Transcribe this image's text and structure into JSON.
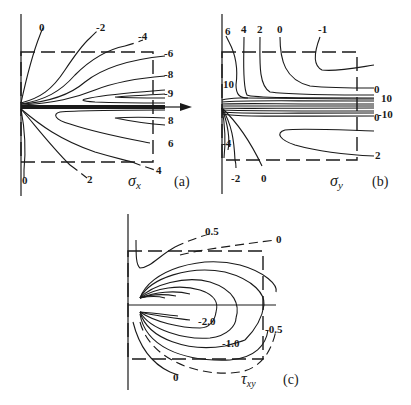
{
  "figure": {
    "panels": [
      {
        "id": "a",
        "caption": "(a)",
        "symbol": "σ",
        "symbol_sub": "x",
        "contour_labels": [
          "0",
          "-2",
          "-4",
          "-6",
          "-8",
          "-9",
          "8",
          "6",
          "4",
          "2",
          "0"
        ]
      },
      {
        "id": "b",
        "caption": "(b)",
        "symbol": "σ",
        "symbol_sub": "y",
        "contour_labels": [
          "6",
          "4",
          "2",
          "0",
          "-1",
          "10",
          "0",
          "10",
          "-10",
          "0",
          "2",
          "-4",
          "-2",
          "0"
        ]
      },
      {
        "id": "c",
        "caption": "(c)",
        "symbol": "τ",
        "symbol_sub": "xy",
        "contour_labels": [
          "0.5",
          "0",
          "-2.0",
          "-1.0",
          "-0.5",
          "0"
        ]
      }
    ]
  },
  "a": {
    "top0": "0",
    "m2": "-2",
    "m4": "-4",
    "m6": "-6",
    "m8": "-8",
    "m9": "-9",
    "p8": "8",
    "p6": "6",
    "p4": "4",
    "p2": "2",
    "bot0": "0",
    "sym": "σ",
    "sub": "x",
    "cap": "(a)"
  },
  "b": {
    "l6": "6",
    "l4": "4",
    "l2": "2",
    "l0": "0",
    "lm1": "-1",
    "l10left": "10",
    "r0top": "0",
    "r10": "10",
    "rm10": "-10",
    "r0bot": "0",
    "r2": "2",
    "m4": "-4",
    "m2": "-2",
    "b0": "0",
    "sym": "σ",
    "sub": "y",
    "cap": "(b)"
  },
  "c": {
    "p05": "0.5",
    "z_top": "0",
    "m20": "-2.0",
    "m10": "-1.0",
    "m05": "-0.5",
    "z_bot": "0",
    "sym": "τ",
    "sub": "xy",
    "cap": "(c)"
  }
}
